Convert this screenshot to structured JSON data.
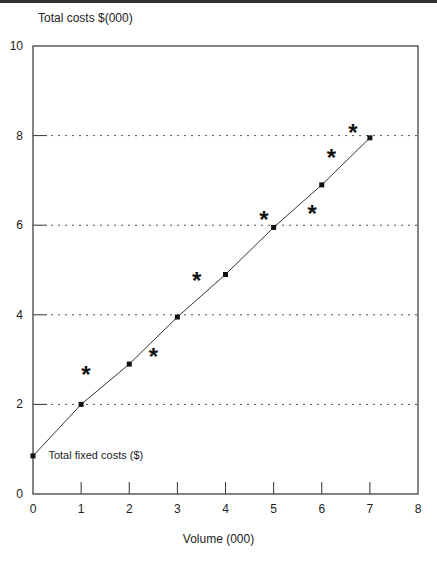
{
  "chart_data": {
    "type": "line",
    "title": "",
    "ylabel": "Total costs $(000)",
    "xlabel": "Volume (000)",
    "xlim": [
      0,
      8
    ],
    "ylim": [
      0,
      10
    ],
    "x_ticks": [
      "0",
      "1",
      "2",
      "3",
      "4",
      "5",
      "6",
      "7",
      "8"
    ],
    "y_ticks": [
      "0",
      "2",
      "4",
      "6",
      "8",
      "10"
    ],
    "gridlines": {
      "orientation": "horizontal",
      "style": "dotted",
      "at": [
        2,
        4,
        6,
        8
      ]
    },
    "series": [
      {
        "name": "Fitted total cost line",
        "marker": "square",
        "x": [
          0,
          1,
          2,
          3,
          4,
          5,
          6,
          7
        ],
        "values": [
          0.85,
          2.0,
          2.9,
          3.95,
          4.9,
          5.95,
          6.9,
          7.95
        ]
      },
      {
        "name": "Observed costs",
        "marker": "asterisk",
        "type": "scatter",
        "x": [
          1.1,
          2.5,
          3.4,
          4.8,
          5.8,
          6.2,
          6.65
        ],
        "values": [
          2.7,
          3.1,
          4.8,
          6.15,
          6.3,
          7.55,
          8.1
        ]
      }
    ],
    "annotations": [
      {
        "text": "Total fixed costs ($)",
        "x": 0.3,
        "y": 0.85
      }
    ],
    "legend": "none"
  }
}
